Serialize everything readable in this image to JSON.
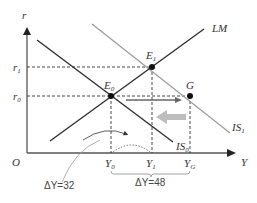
{
  "diagram": {
    "type": "IS-LM",
    "axes": {
      "y_label": "r",
      "x_label": "Y",
      "origin_label": "O",
      "y_ticks": [
        {
          "label": "r",
          "sub": "1"
        },
        {
          "label": "r",
          "sub": "0"
        }
      ],
      "x_ticks": [
        {
          "label": "Y",
          "sub": "0"
        },
        {
          "label": "Y",
          "sub": "1"
        },
        {
          "label": "Y",
          "sub": "G"
        }
      ]
    },
    "curves": {
      "lm": "LM",
      "is0": {
        "label": "IS",
        "sub": "0"
      },
      "is1": {
        "label": "IS",
        "sub": "1"
      }
    },
    "points": {
      "e0": {
        "label": "E",
        "sub": "0"
      },
      "e1": {
        "label": "E",
        "sub": "1"
      },
      "g": {
        "label": "G"
      }
    },
    "annotations": {
      "delta_small": "ΔY=32",
      "delta_large": "ΔY=48"
    },
    "colors": {
      "line_dark": "#2a2a2a",
      "line_gray": "#9a9a9a",
      "arrow_dark": "#666666",
      "arrow_light": "#bdbdbd"
    }
  }
}
